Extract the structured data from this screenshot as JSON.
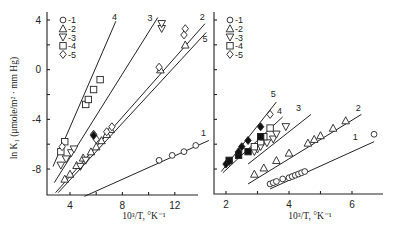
{
  "figure": {
    "ylabel": "ln K₁ (μmole/m² · mm Hg)",
    "xlabel": "10³/T, °K⁻¹",
    "legend": [
      "○-1",
      "△-2",
      "▽-3",
      "□-4",
      "◇-5"
    ]
  },
  "chart_data": [
    {
      "type": "scatter",
      "title": "",
      "xlabel": "10³/T, °K⁻¹",
      "ylabel": "ln K₁ (μmole/m² · mm Hg)",
      "xlim": [
        2.5,
        14.5
      ],
      "ylim": [
        -10.1,
        4.3
      ],
      "xticks": [
        4,
        8,
        12
      ],
      "yticks": [
        4,
        0,
        -4,
        -8
      ],
      "grid": false,
      "legend_position": "upper left",
      "legend": [
        "-1",
        "-2",
        "-3",
        "-4",
        "-5"
      ],
      "series": [
        {
          "name": "1",
          "marker": "circle",
          "points": [
            [
              10.8,
              -7.3
            ],
            [
              11.8,
              -6.9
            ],
            [
              12.7,
              -6.6
            ],
            [
              13.6,
              -6.1
            ]
          ],
          "fit": [
            [
              5.1,
              -10.2
            ],
            [
              14.6,
              -5.7
            ]
          ],
          "label_at": [
            14.2,
            -5.3
          ]
        },
        {
          "name": "2",
          "marker": "triangle-up",
          "points": [
            [
              3.6,
              -8.8
            ],
            [
              4.0,
              -8.4
            ],
            [
              4.5,
              -7.7
            ],
            [
              5.0,
              -7.1
            ],
            [
              5.6,
              -6.6
            ],
            [
              6.0,
              -6.2
            ],
            [
              6.4,
              -5.7
            ],
            [
              6.8,
              -5.2
            ],
            [
              7.1,
              -4.8
            ],
            [
              10.9,
              0.0
            ],
            [
              12.8,
              2.0
            ]
          ],
          "fit": [
            [
              2.9,
              -9.9
            ],
            [
              14.3,
              3.7
            ]
          ],
          "label_at": [
            14.1,
            4.0
          ]
        },
        {
          "name": "3",
          "marker": "triangle-down",
          "points": [
            [
              3.3,
              -7.7
            ],
            [
              3.7,
              -7.2
            ],
            [
              4.1,
              -6.7
            ],
            [
              4.3,
              -6.4
            ],
            [
              4.8,
              -7.8
            ],
            [
              5.2,
              -7.3
            ],
            [
              11.0,
              3.3
            ],
            [
              11.0,
              3.7
            ]
          ],
          "fit": [
            [
              2.8,
              -9.1
            ],
            [
              10.7,
              4.2
            ]
          ],
          "label_at": [
            10.1,
            3.9
          ]
        },
        {
          "name": "4",
          "marker": "square",
          "points": [
            [
              3.3,
              -6.6
            ],
            [
              3.6,
              -5.8
            ],
            [
              5.2,
              -2.8
            ],
            [
              5.4,
              -2.4
            ],
            [
              5.8,
              -1.6
            ],
            [
              6.3,
              -0.8
            ]
          ],
          "fit": [
            [
              2.7,
              -7.8
            ],
            [
              7.5,
              3.9
            ]
          ],
          "label_at": [
            7.4,
            4.0
          ]
        },
        {
          "name": "5",
          "marker": "diamond",
          "points": [
            [
              3.4,
              -6.2
            ],
            [
              5.8,
              -5.2
            ],
            [
              6.0,
              -5.6
            ],
            [
              6.8,
              -5.0
            ],
            [
              7.2,
              -4.6
            ],
            [
              10.8,
              0.2
            ],
            [
              12.7,
              2.8
            ],
            [
              12.8,
              3.3
            ]
          ],
          "filled_points": [
            [
              5.8,
              -5.3
            ]
          ],
          "fit": [
            [
              3.1,
              -9.9
            ],
            [
              14.4,
              3.0
            ]
          ],
          "label_at": [
            14.3,
            2.2
          ]
        }
      ]
    },
    {
      "type": "scatter",
      "title": "",
      "xlabel": "10³/T, °K⁻¹",
      "ylabel": "",
      "xlim": [
        1.6,
        7.0
      ],
      "ylim": [
        -10.1,
        4.3
      ],
      "xticks": [
        2,
        4,
        6
      ],
      "yticks": [
        4,
        2,
        0,
        -2,
        -4,
        -6,
        -8
      ],
      "grid": false,
      "legend_position": "upper left",
      "legend": [
        "-1",
        "-2",
        "-3",
        "-4",
        "-5"
      ],
      "series": [
        {
          "name": "1",
          "marker": "circle",
          "points": [
            [
              3.4,
              -9.2
            ],
            [
              3.5,
              -9.1
            ],
            [
              3.6,
              -9.0
            ],
            [
              3.8,
              -8.8
            ],
            [
              4.0,
              -8.7
            ],
            [
              4.1,
              -8.6
            ],
            [
              4.2,
              -8.5
            ],
            [
              4.3,
              -8.4
            ],
            [
              4.4,
              -8.3
            ],
            [
              4.5,
              -8.2
            ],
            [
              6.7,
              -5.2
            ]
          ],
          "fit": [
            [
              3.4,
              -9.6
            ],
            [
              6.7,
              -5.8
            ]
          ],
          "label_at": [
            6.1,
            -5.7
          ]
        },
        {
          "name": "2",
          "marker": "triangle-up",
          "points": [
            [
              2.9,
              -8.4
            ],
            [
              3.2,
              -7.9
            ],
            [
              3.6,
              -7.3
            ],
            [
              4.0,
              -6.7
            ],
            [
              4.6,
              -5.9
            ],
            [
              4.8,
              -5.6
            ],
            [
              5.0,
              -5.3
            ],
            [
              5.4,
              -4.7
            ],
            [
              5.8,
              -4.1
            ]
          ],
          "fit": [
            [
              2.7,
              -9.2
            ],
            [
              6.3,
              -3.6
            ]
          ],
          "label_at": [
            6.2,
            -3.3
          ]
        },
        {
          "name": "3",
          "marker": "triangle-down",
          "points": [
            [
              2.9,
              -6.6
            ],
            [
              3.0,
              -6.4
            ],
            [
              3.1,
              -6.2
            ],
            [
              3.3,
              -5.9
            ],
            [
              3.5,
              -5.6
            ],
            [
              3.6,
              -5.2
            ],
            [
              3.9,
              -4.6
            ]
          ],
          "fit": [
            [
              2.7,
              -7.6
            ],
            [
              4.7,
              -3.6
            ]
          ],
          "label_at": [
            4.3,
            -3.3
          ]
        },
        {
          "name": "4",
          "marker": "square",
          "points": [
            [
              2.1,
              -7.3
            ],
            [
              2.4,
              -6.9
            ],
            [
              2.7,
              -6.6
            ],
            [
              2.9,
              -6.2
            ],
            [
              3.1,
              -5.8
            ],
            [
              3.2,
              -5.4
            ],
            [
              3.4,
              -4.7
            ]
          ],
          "filled_points": [
            [
              2.1,
              -7.3
            ],
            [
              2.4,
              -6.9
            ],
            [
              2.7,
              -6.6
            ],
            [
              3.1,
              -5.4
            ]
          ],
          "fit": [
            [
              1.9,
              -8.3
            ],
            [
              3.8,
              -3.8
            ]
          ],
          "label_at": [
            3.7,
            -3.6
          ]
        },
        {
          "name": "5",
          "marker": "diamond",
          "points": [
            [
              2.0,
              -7.6
            ],
            [
              2.1,
              -7.4
            ],
            [
              2.4,
              -6.6
            ],
            [
              2.5,
              -6.2
            ],
            [
              2.7,
              -5.7
            ],
            [
              3.1,
              -4.6
            ],
            [
              3.4,
              -3.6
            ]
          ],
          "filled_points": [
            [
              2.0,
              -7.6
            ],
            [
              2.1,
              -7.4
            ],
            [
              2.4,
              -6.6
            ],
            [
              2.5,
              -6.2
            ],
            [
              2.7,
              -5.7
            ],
            [
              3.1,
              -4.6
            ]
          ],
          "fit": [
            [
              1.85,
              -8.2
            ],
            [
              3.6,
              -2.6
            ]
          ],
          "label_at": [
            3.5,
            -2.2
          ]
        }
      ]
    }
  ]
}
